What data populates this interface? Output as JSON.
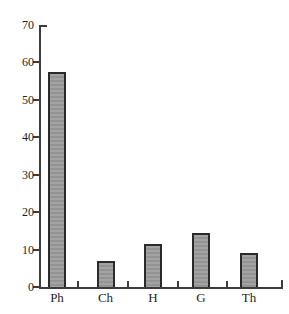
{
  "chart_data": {
    "type": "bar",
    "categories": [
      "Ph",
      "Ch",
      "H",
      "G",
      "Th"
    ],
    "values": [
      57.5,
      7,
      11.5,
      14.5,
      9
    ],
    "title": "",
    "xlabel": "",
    "ylabel": "",
    "ylim": [
      0,
      70
    ],
    "yticks": [
      0,
      10,
      20,
      30,
      40,
      50,
      60,
      70
    ],
    "grid": false,
    "legend": false,
    "colors": {
      "bar_fill": "#9c9c9c",
      "bar_border": "#2b2b2b",
      "axis": "#3c3c3c",
      "text": "#1f1f1f",
      "background": "#ffffff"
    }
  }
}
